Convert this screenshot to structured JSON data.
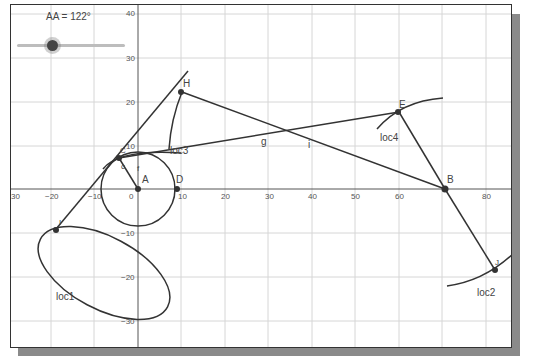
{
  "slider": {
    "label": "AA = 122°",
    "name": "AA",
    "value": 122,
    "unit": "°"
  },
  "axes": {
    "x_ticks": [
      "−20",
      "−10",
      "0",
      "10",
      "20",
      "30",
      "40",
      "50",
      "60",
      "70",
      "80"
    ],
    "y_ticks": [
      "40",
      "30",
      "20",
      "10",
      "−10",
      "−20",
      "−30"
    ],
    "x_edge_label": "30"
  },
  "points": {
    "A": {
      "label": "A",
      "x": 0,
      "y": 0
    },
    "D": {
      "label": "D",
      "x": 9,
      "y": 0
    },
    "B": {
      "label": "B",
      "x": 70.5,
      "y": 0
    },
    "H": {
      "label": "H",
      "x": 10,
      "y": 22
    },
    "E": {
      "label": "E",
      "x": 60,
      "y": 17.5
    },
    "C": {
      "label": "C",
      "x": -4.5,
      "y": 7
    },
    "I": {
      "label": "I",
      "x": -18,
      "y": -9
    },
    "J": {
      "label": "J",
      "x": 82,
      "y": -18.5
    }
  },
  "labels": {
    "loc1": "loc1",
    "loc2": "loc2",
    "loc3": "loc3",
    "loc4": "loc4",
    "g": "g",
    "i": "i",
    "f": "f",
    "h": "h",
    "c": "c",
    "b_small": "h"
  }
}
